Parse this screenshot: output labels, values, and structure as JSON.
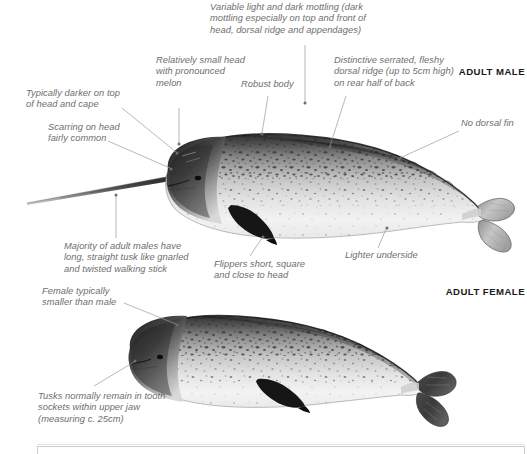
{
  "plate": {
    "title": "Narwhal identification plate",
    "species": "Narwhal",
    "background_color": "#ffffff",
    "note_color": "#6e6e6e",
    "label_color": "#1a1a1a"
  },
  "sex_labels": {
    "male": "ADULT MALE",
    "female": "ADULT FEMALE"
  },
  "annotations": [
    {
      "id": "mottling",
      "text": "Variable light and dark mottling (dark\nmottling especially on top and front of\nhead, dorsal ridge and appendages)"
    },
    {
      "id": "small-head",
      "text": "Relatively small head\nwith pronounced\nmelon"
    },
    {
      "id": "robust-body",
      "text": "Robust body"
    },
    {
      "id": "dorsal-ridge",
      "text": "Distinctive serrated, fleshy\ndorsal ridge (up to 5cm high)\non rear half of back"
    },
    {
      "id": "darker-top",
      "text": "Typically darker on top\nof head and cape"
    },
    {
      "id": "no-dorsal-fin",
      "text": "No dorsal fin"
    },
    {
      "id": "scarring",
      "text": "Scarring on head\nfairly common"
    },
    {
      "id": "tusk",
      "text": "Majority of adult males have\nlong, straight tusk like gnarled\nand twisted walking stick"
    },
    {
      "id": "flippers",
      "text": "Flippers short, square\nand close to head"
    },
    {
      "id": "lighter-underside",
      "text": "Lighter underside"
    },
    {
      "id": "female-smaller",
      "text": "Female typically\nsmaller than male"
    },
    {
      "id": "female-tusks",
      "text": "Tusks normally remain in tooth\nsockets within upper jaw\n(measuring c. 25cm)"
    }
  ]
}
